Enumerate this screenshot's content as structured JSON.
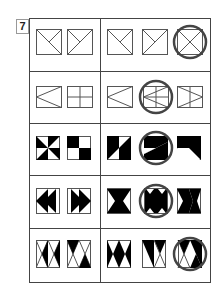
{
  "question_number": "7",
  "puzzle": {
    "rows": [
      {
        "given": [
          "square-full-diag-tlbr-half-tr",
          "square-full-diag-trbl-half-tl"
        ],
        "sequence": [
          "square-full-diag-tlbr-half-tr",
          "square-full-diag-trbl-half-tl",
          "square-full-x"
        ],
        "answer_index": 2
      },
      {
        "given": [
          "rect-left-chevron",
          "rect-cross"
        ],
        "sequence": [
          "rect-left-chevron",
          "rect-left-chevron-cross",
          "rect-right-chevron-vline"
        ],
        "answer_index": 1
      },
      {
        "given": [
          "square-pinwheel-black",
          "square-checker-tl-br"
        ],
        "sequence": [
          "square-diagonal-split-black",
          "square-diagonal-split-black-circled",
          "square-diagonal-split-black-alt"
        ],
        "answer_index": 1
      },
      {
        "given": [
          "rect-double-left-arrows",
          "rect-double-right-arrows"
        ],
        "sequence": [
          "rect-bowtie-black",
          "rect-bowtie-black-full",
          "rect-bowtie-black-right"
        ],
        "answer_index": 1
      },
      {
        "given": [
          "rect-hourglass-outline",
          "rect-hourglass-black-corners"
        ],
        "sequence": [
          "rect-hourglass-black",
          "rect-hourglass-half-black",
          "rect-hourglass-circled"
        ],
        "answer_index": 2
      }
    ]
  }
}
